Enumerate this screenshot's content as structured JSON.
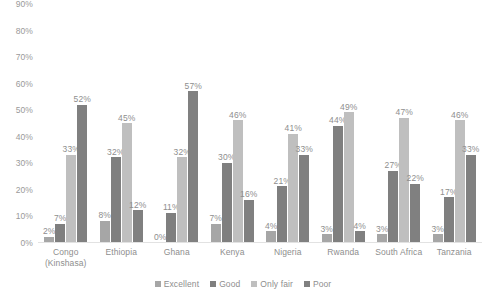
{
  "chart_data": {
    "type": "bar",
    "title": "",
    "subtitle": "",
    "xlabel": "",
    "ylabel": "",
    "ylim": [
      0,
      90
    ],
    "ytick_step": 10,
    "ytick_labels": [
      "0%",
      "10%",
      "20%",
      "30%",
      "40%",
      "50%",
      "60%",
      "70%",
      "80%",
      "90%"
    ],
    "grid": false,
    "legend_position": "bottom",
    "value_suffix": "%",
    "categories": [
      "Congo\n(Kinshasa)",
      "Ethiopia",
      "Ghana",
      "Kenya",
      "Nigeria",
      "Rwanda",
      "South Africa",
      "Tanzania"
    ],
    "series": [
      {
        "name": "Excellent",
        "color": "#a6a6a6",
        "values": [
          2,
          8,
          0,
          7,
          4,
          3,
          3,
          3
        ],
        "labels": [
          "2%",
          "8%",
          "0%",
          "7%",
          "4%",
          "3%",
          "3%",
          "3%"
        ]
      },
      {
        "name": "Good",
        "color": "#7f7f7f",
        "values": [
          7,
          32,
          11,
          30,
          21,
          44,
          27,
          17
        ],
        "labels": [
          "7%",
          "32%",
          "11%",
          "30%",
          "21%",
          "44%",
          "27%",
          "17%"
        ]
      },
      {
        "name": "Only fair",
        "color": "#bfbfbf",
        "values": [
          33,
          45,
          32,
          46,
          41,
          49,
          47,
          46
        ],
        "labels": [
          "33%",
          "45%",
          "32%",
          "46%",
          "41%",
          "49%",
          "47%",
          "46%"
        ]
      },
      {
        "name": "Poor",
        "color": "#808080",
        "values": [
          52,
          12,
          57,
          16,
          33,
          4,
          22,
          33
        ],
        "labels": [
          "52%",
          "12%",
          "57%",
          "16%",
          "33%",
          "4%",
          "22%",
          "33%"
        ]
      }
    ]
  }
}
